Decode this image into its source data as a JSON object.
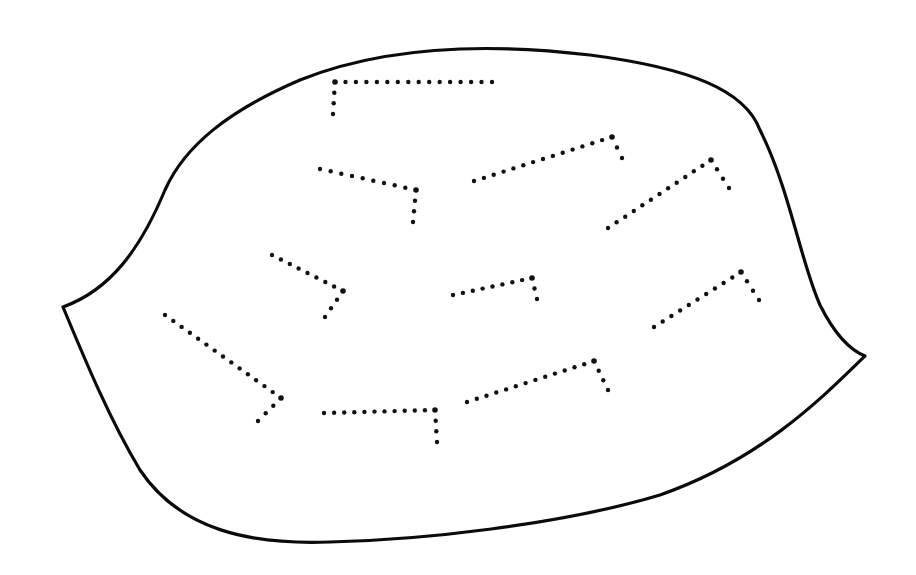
{
  "diagram": {
    "canvas": {
      "width": 916,
      "height": 575,
      "background": "#ffffff"
    },
    "outline": {
      "name": "leaf-blob-outline",
      "stroke": "#0b0b0b",
      "path": "M 63 307 C 110 290, 140 250, 165 190 C 185 145, 230 110, 300 80 C 380 48, 480 42, 590 55 C 690 68, 745 90, 760 130 C 790 190, 800 260, 820 305 C 835 335, 850 350, 865 356 C 820 400, 760 460, 660 495 C 560 525, 420 540, 330 542 C 250 545, 180 530, 140 470 C 110 420, 85 360, 63 307 Z"
    },
    "dot_color": "#111111",
    "dot_spacing": 10.5,
    "dot_radius": 2.2,
    "marks": [
      {
        "id": "mark-1",
        "points": [
          [
            492,
            82
          ],
          [
            335,
            82
          ],
          [
            333,
            114
          ]
        ]
      },
      {
        "id": "mark-2",
        "points": [
          [
            320,
            169
          ],
          [
            416,
            190
          ],
          [
            413,
            222
          ]
        ]
      },
      {
        "id": "mark-3",
        "points": [
          [
            474,
            181
          ],
          [
            612,
            137
          ],
          [
            622,
            158
          ]
        ]
      },
      {
        "id": "mark-4",
        "points": [
          [
            608,
            228
          ],
          [
            711,
            160
          ],
          [
            729,
            188
          ]
        ]
      },
      {
        "id": "mark-5",
        "points": [
          [
            272,
            255
          ],
          [
            343,
            291
          ],
          [
            325,
            317
          ]
        ]
      },
      {
        "id": "mark-6",
        "points": [
          [
            453,
            295
          ],
          [
            532,
            278
          ],
          [
            537,
            299
          ]
        ]
      },
      {
        "id": "mark-7",
        "points": [
          [
            654,
            327
          ],
          [
            741,
            272
          ],
          [
            759,
            300
          ]
        ]
      },
      {
        "id": "mark-8",
        "points": [
          [
            165,
            315
          ],
          [
            281,
            398
          ],
          [
            258,
            421
          ]
        ]
      },
      {
        "id": "mark-9",
        "points": [
          [
            324,
            413
          ],
          [
            435,
            410
          ],
          [
            437,
            442
          ]
        ]
      },
      {
        "id": "mark-10",
        "points": [
          [
            467,
            402
          ],
          [
            594,
            361
          ],
          [
            608,
            390
          ]
        ]
      }
    ]
  }
}
